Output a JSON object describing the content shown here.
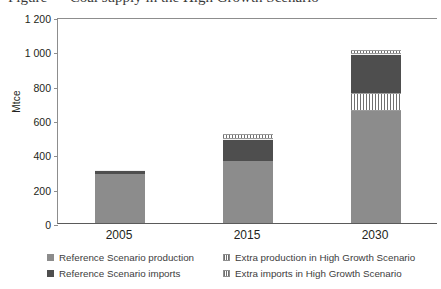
{
  "title": "Figure — Coal supply in the High Growth Scenario",
  "axes": {
    "ylabel": "Mtce",
    "yticks": [
      "1 200",
      "1 000",
      "800",
      "600",
      "400",
      "200",
      "0"
    ],
    "xticks": [
      "2005",
      "2015",
      "2030"
    ]
  },
  "legend": {
    "items": [
      {
        "label": "Reference Scenario production",
        "swatch": "prod"
      },
      {
        "label": "Extra production in High Growth Scenario",
        "swatch": "hatch"
      },
      {
        "label": "Reference Scenario imports",
        "swatch": "imp"
      },
      {
        "label": "Extra imports in High Growth Scenario",
        "swatch": "hatch"
      }
    ]
  },
  "colors": {
    "reference_production": "#8c8c8c",
    "reference_imports": "#4e4e4e",
    "extra_hatch": "#707070",
    "axis": "#8d8d8d",
    "text": "#231f20"
  },
  "chart_data": {
    "type": "bar",
    "stacked": true,
    "title": "Coal supply in the High Growth Scenario",
    "xlabel": "",
    "ylabel": "Mtce",
    "ylim": [
      0,
      1200
    ],
    "ytick_step": 200,
    "grid": false,
    "legend_position": "bottom",
    "categories": [
      "2005",
      "2015",
      "2030"
    ],
    "series": [
      {
        "name": "Reference Scenario production",
        "values": [
          286,
          360,
          650
        ]
      },
      {
        "name": "Extra production in High Growth Scenario",
        "values": [
          0,
          0,
          105
        ]
      },
      {
        "name": "Reference Scenario imports",
        "values": [
          23,
          130,
          230
        ]
      },
      {
        "name": "Extra imports in High Growth Scenario",
        "values": [
          0,
          30,
          25
        ]
      }
    ],
    "totals": [
      309,
      520,
      1010
    ]
  }
}
